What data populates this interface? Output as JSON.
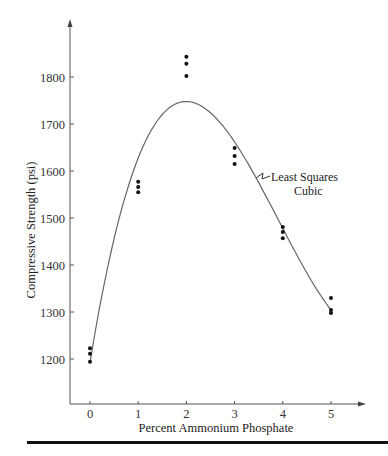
{
  "chart_data": {
    "type": "scatter",
    "title": "",
    "xlabel": "Percent Ammonium Phosphate",
    "ylabel": "Compressive Strength (psi)",
    "xlim": [
      -0.4,
      5.7
    ],
    "ylim": [
      1100,
      1900
    ],
    "x_ticks": [
      0,
      1,
      2,
      3,
      4,
      5
    ],
    "y_ticks": [
      1200,
      1300,
      1400,
      1500,
      1600,
      1700,
      1800
    ],
    "grid": false,
    "series": [
      {
        "name": "Observations",
        "type": "scatter",
        "points": [
          {
            "x": 0,
            "y": 1223
          },
          {
            "x": 0,
            "y": 1211
          },
          {
            "x": 0,
            "y": 1194
          },
          {
            "x": 1,
            "y": 1577
          },
          {
            "x": 1,
            "y": 1566
          },
          {
            "x": 1,
            "y": 1555
          },
          {
            "x": 2,
            "y": 1843
          },
          {
            "x": 2,
            "y": 1828
          },
          {
            "x": 2,
            "y": 1802
          },
          {
            "x": 3,
            "y": 1649
          },
          {
            "x": 3,
            "y": 1632
          },
          {
            "x": 3,
            "y": 1615
          },
          {
            "x": 4,
            "y": 1481
          },
          {
            "x": 4,
            "y": 1470
          },
          {
            "x": 4,
            "y": 1457
          },
          {
            "x": 5,
            "y": 1330
          },
          {
            "x": 5,
            "y": 1304
          },
          {
            "x": 5,
            "y": 1298
          }
        ]
      },
      {
        "name": "Least Squares Cubic",
        "type": "line",
        "x": [
          0,
          0.25,
          0.5,
          0.75,
          1,
          1.25,
          1.5,
          1.75,
          2,
          2.25,
          2.5,
          2.75,
          3,
          3.25,
          3.5,
          3.75,
          4,
          4.25,
          4.5,
          4.75,
          5
        ],
        "y": [
          1228,
          1370,
          1486,
          1578,
          1647,
          1697,
          1729,
          1745,
          1749,
          1741,
          1723,
          1698,
          1667,
          1632,
          1594,
          1556,
          1519,
          1485,
          1455,
          1432,
          1308
        ]
      }
    ],
    "annotations": [
      {
        "text": "Least Squares",
        "line2": "Cubic",
        "points_to": "curve",
        "x": 3.4
      }
    ]
  },
  "labels": {
    "xlabel": "Percent Ammonium Phosphate",
    "ylabel": "Compressive Strength (psi)",
    "annot_line1": "Least Squares",
    "annot_line2": "Cubic",
    "xticks": [
      "0",
      "1",
      "2",
      "3",
      "4",
      "5"
    ],
    "yticks": [
      "1200",
      "1300",
      "1400",
      "1500",
      "1600",
      "1700",
      "1800"
    ]
  }
}
